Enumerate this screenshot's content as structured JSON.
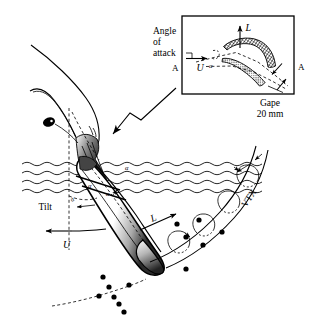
{
  "figure": {
    "domain": "diagram",
    "background_color": "#ffffff",
    "ink_color": "#000000",
    "width": 318,
    "height": 330
  },
  "inset": {
    "name": "bill-cross-section-inset",
    "section_label_left": "A",
    "section_label_right": "A",
    "lift_label": "L",
    "velocity_label": "U",
    "angle_of_attack_label_line1": "Angle",
    "angle_of_attack_label_line2": "of",
    "angle_of_attack_label_line3": "attack",
    "angle_symbol": "α",
    "gape_label": "Gape",
    "gape_value": "20 mm"
  },
  "main": {
    "name": "feeding-bird-scene",
    "tilt_label": "Tilt",
    "velocity_label": "U",
    "lift_label": "L",
    "vortex_label": "VTX",
    "angle_marker_1": "α",
    "angle_marker_2": "α",
    "angle_marker_3": "α",
    "angle_marker_4": "α"
  }
}
